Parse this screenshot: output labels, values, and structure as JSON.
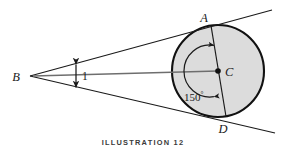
{
  "figure": {
    "caption_text": "ILLUSTRATION",
    "caption_number": "12",
    "background_color": "#ffffff",
    "line_color": "#1a1a1a",
    "circle_fill_color": "#dcdcdc",
    "circle_stroke_color": "#111111"
  },
  "labels": {
    "point_a": "A",
    "point_b": "B",
    "point_c": "C",
    "point_d": "D",
    "distance": "1",
    "angle_value": "150",
    "angle_degree_symbol": "°"
  },
  "geometry": {
    "circle": {
      "cx": 218,
      "cy": 71,
      "r": 46
    },
    "points": {
      "A": {
        "x": 211,
        "y": 25.6
      },
      "B": {
        "x": 30,
        "y": 76
      },
      "C": {
        "x": 218,
        "y": 71
      },
      "D": {
        "x": 226,
        "y": 116.5
      }
    },
    "tangent_upper": {
      "x1": 30,
      "y1": 76,
      "x2": 272,
      "y2": 10
    },
    "tangent_lower": {
      "x1": 30,
      "y1": 76,
      "x2": 275,
      "y2": 133
    },
    "axis_line": {
      "x1": 30,
      "y1": 76,
      "x2": 218,
      "y2": 71
    },
    "chord_AD": {
      "x1": 211,
      "y1": 25.6,
      "x2": 226,
      "y2": 116.5
    },
    "measure_arrow": {
      "x": 76,
      "y_top": 63,
      "y_bottom": 89
    },
    "angle_arc": {
      "cx": 218,
      "cy": 71,
      "radius": 26,
      "start_deg": 99,
      "end_deg": 249,
      "sweep": 150
    }
  }
}
